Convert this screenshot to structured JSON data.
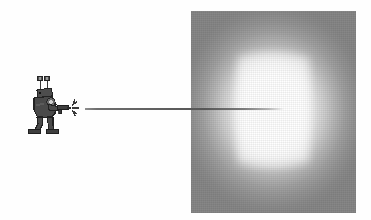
{
  "scene": {
    "title": "Figure: character firing an energy beam at an illuminated panel",
    "background_color": "#fefefe",
    "width": 371,
    "height": 220
  },
  "character": {
    "name": "beam-shooter-character",
    "description": "Stylized dark-gray cartoon figure with two antennae, shown in profile facing right, holding a ray gun",
    "body_color": "#4a4a4a",
    "outline_color": "#262626",
    "highlight_color": "#c9c9c9",
    "parts": {
      "antenna_left": "antenna-left",
      "antenna_right": "antenna-right",
      "head": "head",
      "torso": "torso",
      "arm": "firing-arm",
      "ray_gun": "ray-gun",
      "leg_front": "leg-front",
      "leg_back": "leg-back",
      "foot_front": "foot-front",
      "foot_back": "foot-back",
      "muzzle_flash": "muzzle-flash-spark"
    }
  },
  "beam": {
    "name": "energy-beam",
    "color_start": "#6e6e6e",
    "color_end": "#c8c8c8",
    "start_x": 85,
    "end_x": 284,
    "y": 108,
    "thickness_px": 2
  },
  "target_panel": {
    "name": "illuminated-target-panel",
    "edge_color": "#8d8d8d",
    "center_color": "#ffffff",
    "left": 191,
    "top": 11,
    "width": 165,
    "height": 202,
    "gradient_type": "radial-rectangular",
    "texture": "halftone-dither"
  }
}
